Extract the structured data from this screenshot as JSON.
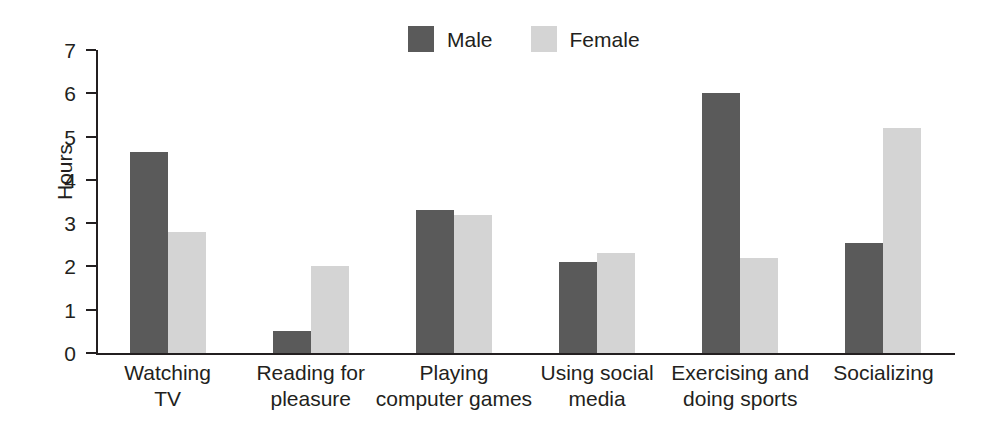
{
  "chart_data": {
    "type": "bar",
    "title": "",
    "subtitle": "",
    "xlabel": "",
    "ylabel": "Hours",
    "ylim": [
      0,
      7
    ],
    "ytick_values": [
      0,
      1,
      2,
      3,
      4,
      5,
      6,
      7
    ],
    "ytick_labels": [
      "0",
      "1",
      "2",
      "3",
      "4",
      "5",
      "6",
      "7"
    ],
    "grid": false,
    "legend_position": "top-center",
    "categories": [
      "Watching TV",
      "Reading for pleasure",
      "Playing computer games",
      "Using social media",
      "Exercising and doing sports",
      "Socializing"
    ],
    "category_lines": [
      [
        "Watching",
        "TV"
      ],
      [
        "Reading for",
        "pleasure"
      ],
      [
        "Playing",
        "computer games"
      ],
      [
        "Using social",
        "media"
      ],
      [
        "Exercising and",
        "doing sports"
      ],
      [
        "Socializing",
        ""
      ]
    ],
    "series": [
      {
        "name": "Male",
        "color": "#5a5a5a",
        "values": [
          4.65,
          0.5,
          3.3,
          2.1,
          6.0,
          2.55
        ]
      },
      {
        "name": "Female",
        "color": "#d4d4d4",
        "values": [
          2.8,
          2.0,
          3.2,
          2.3,
          2.2,
          5.2
        ]
      }
    ]
  },
  "legend": {
    "entries": [
      {
        "label": "Male",
        "color": "#5a5a5a"
      },
      {
        "label": "Female",
        "color": "#d4d4d4"
      }
    ]
  },
  "colors": {
    "male": "#5a5a5a",
    "female": "#d4d4d4",
    "axis": "#231f20",
    "background": "#ffffff"
  }
}
